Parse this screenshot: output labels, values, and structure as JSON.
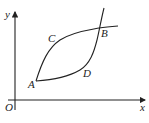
{
  "diagram": {
    "type": "function-curves",
    "axes": {
      "x_label": "x",
      "y_label": "y",
      "origin_label": "O"
    },
    "points": [
      {
        "name": "A",
        "label": "A"
      },
      {
        "name": "B",
        "label": "B"
      },
      {
        "name": "C",
        "label": "C"
      },
      {
        "name": "D",
        "label": "D"
      }
    ],
    "curves": [
      {
        "name": "upper-curve",
        "passes_through": [
          "A",
          "C",
          "B"
        ]
      },
      {
        "name": "lower-curve",
        "passes_through": [
          "A",
          "D",
          "B"
        ]
      }
    ],
    "colors": {
      "stroke": "#222222",
      "background": "#ffffff"
    }
  }
}
